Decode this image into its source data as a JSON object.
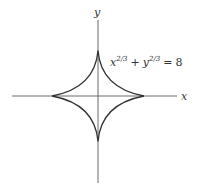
{
  "diagram": {
    "curve": {
      "name": "astroid",
      "equation": {
        "x_base": "x",
        "x_exp": "2/3",
        "plus": "+",
        "y_base": "y",
        "y_exp": "2/3",
        "equals": "=",
        "rhs": "8"
      },
      "stroke_color": "#333333"
    },
    "axes": {
      "x_label": "x",
      "y_label": "y",
      "color": "#666666"
    }
  }
}
